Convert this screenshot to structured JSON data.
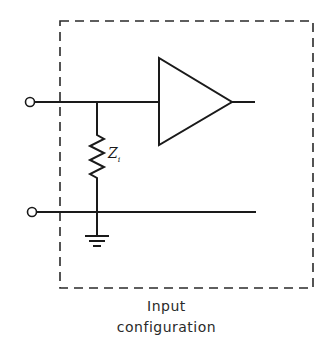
{
  "diagram": {
    "caption_lines": [
      "Input",
      "configuration"
    ],
    "components": {
      "impedance_label": "Z",
      "impedance_subscript": "i",
      "amplifier": "amplifier-triangle",
      "ground": "ground-symbol",
      "input_terminals": 2,
      "enclosure": "dashed-box"
    },
    "colors": {
      "line": "#1a1a1a",
      "background": "#ffffff"
    }
  }
}
